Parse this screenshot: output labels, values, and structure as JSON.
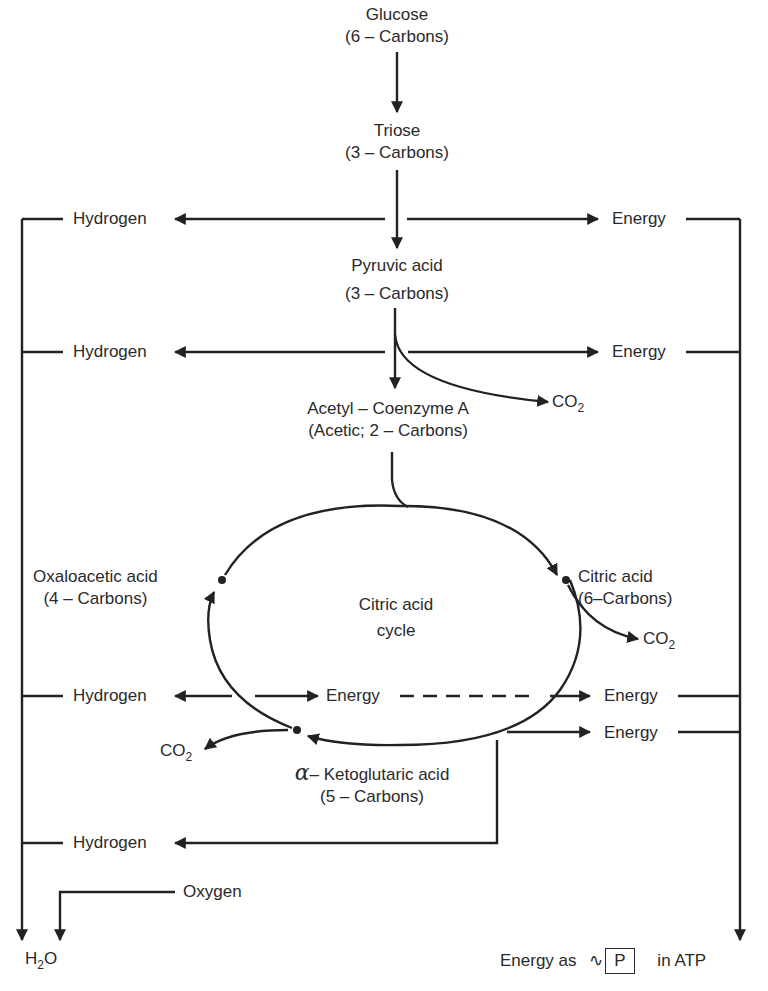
{
  "diagram": {
    "nodes": {
      "glucose": {
        "name": "Glucose",
        "carbons": "(6 – Carbons)"
      },
      "triose": {
        "name": "Triose",
        "carbons": "(3 – Carbons)"
      },
      "pyruvic": {
        "name": "Pyruvic acid",
        "carbons": "(3 – Carbons)"
      },
      "acetyl": {
        "name": "Acetyl – Coenzyme A",
        "carbons": "(Acetic; 2 – Carbons)"
      },
      "oxaloacetic": {
        "name": "Oxaloacetic acid",
        "carbons": "(4 – Carbons)"
      },
      "citric": {
        "name": "Citric acid",
        "carbons": "(6–Carbons)"
      },
      "cycle": {
        "line1": "Citric acid",
        "line2": "cycle"
      },
      "ketoglutaric": {
        "alpha": "α",
        "name": "– Ketoglutaric acid",
        "carbons": "(5 – Carbons)"
      }
    },
    "labels": {
      "hydrogen": "Hydrogen",
      "energy": "Energy",
      "co2_main": "CO",
      "co2_sub": "2",
      "oxygen": "Oxygen",
      "h2o_h": "H",
      "h2o_sub": "2",
      "h2o_o": "O",
      "atp_prefix": "Energy as",
      "atp_tilde": "∿",
      "atp_p": "P",
      "atp_suffix": "in ATP"
    }
  }
}
